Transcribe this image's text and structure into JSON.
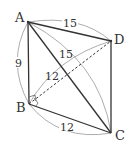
{
  "diagram": {
    "type": "geometry-tetrahedron",
    "vertices": {
      "A": {
        "label": "A",
        "x": 28,
        "y": 22
      },
      "B": {
        "label": "B",
        "x": 29,
        "y": 104
      },
      "C": {
        "label": "C",
        "x": 111,
        "y": 133
      },
      "D": {
        "label": "D",
        "x": 111,
        "y": 41
      }
    },
    "edges": [
      {
        "from": "A",
        "to": "B",
        "style": "solid"
      },
      {
        "from": "A",
        "to": "C",
        "style": "solid"
      },
      {
        "from": "A",
        "to": "D",
        "style": "solid"
      },
      {
        "from": "B",
        "to": "C",
        "style": "solid"
      },
      {
        "from": "C",
        "to": "D",
        "style": "solid"
      },
      {
        "from": "B",
        "to": "D",
        "style": "dashed"
      }
    ],
    "measurements": {
      "AB": "9",
      "AD": "15",
      "AC": "15",
      "BD": "12",
      "BC": "12"
    },
    "right_angle_marker": "B",
    "colors": {
      "line": "#333333",
      "arc": "#8a8a8a",
      "background": "#ffffff"
    }
  }
}
